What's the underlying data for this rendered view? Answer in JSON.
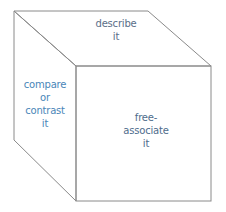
{
  "diagram": {
    "type": "cube",
    "faces": {
      "top": {
        "lines": [
          "describe",
          "it"
        ]
      },
      "left": {
        "lines": [
          "compare",
          "or",
          "contrast",
          "it"
        ]
      },
      "front": {
        "lines": [
          "free-",
          "associate",
          "it"
        ]
      }
    },
    "colors": {
      "edge": "#8a8a8a",
      "top_text": "#5a6e88",
      "left_text": "#4a86b8",
      "front_text": "#4e6c8c"
    }
  }
}
